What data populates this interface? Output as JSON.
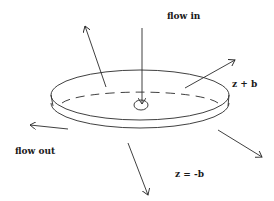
{
  "diagram": {
    "type": "radial-flow-disk",
    "labels": {
      "flow_in": "flow in",
      "flow_out": "flow out",
      "top_plane": "z + b",
      "bottom_plane": "z = -b"
    },
    "colors": {
      "line": "#2a2a2a",
      "text": "#1a1a1a",
      "background": "#ffffff"
    },
    "elements": [
      {
        "name": "top-disk-ellipse",
        "kind": "ellipse",
        "cx": 140,
        "cy": 95,
        "rx": 89,
        "ry": 25
      },
      {
        "name": "bottom-disk-ellipse",
        "kind": "ellipse",
        "cx": 140,
        "cy": 103,
        "rx": 89,
        "ry": 25
      },
      {
        "name": "inlet-circle",
        "kind": "ellipse",
        "cx": 141,
        "cy": 105,
        "rx": 7,
        "ry": 5
      },
      {
        "name": "inflow-arrow",
        "from": [
          142,
          28
        ],
        "to": [
          142,
          104
        ]
      },
      {
        "name": "outflow-arrow-upper-left",
        "from": [
          106,
          87
        ],
        "to": [
          85,
          26
        ]
      },
      {
        "name": "outflow-arrow-upper-right",
        "from": [
          185,
          88
        ],
        "to": [
          235,
          60
        ]
      },
      {
        "name": "outflow-arrow-left",
        "from": [
          68,
          129
        ],
        "to": [
          30,
          125
        ]
      },
      {
        "name": "outflow-arrow-down",
        "from": [
          128,
          143
        ],
        "to": [
          148,
          195
        ]
      },
      {
        "name": "outflow-arrow-lower-right",
        "from": [
          218,
          130
        ],
        "to": [
          262,
          157
        ]
      }
    ]
  }
}
